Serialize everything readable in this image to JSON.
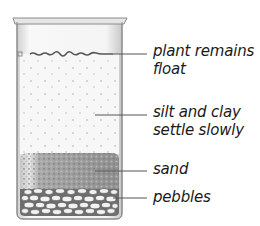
{
  "diagram": {
    "layers": [
      {
        "id": "surface",
        "label_lines": [
          "plant remains",
          "float"
        ]
      },
      {
        "id": "water",
        "label_lines": [
          "silt and clay",
          "settle slowly"
        ]
      },
      {
        "id": "sand",
        "label_lines": [
          "sand"
        ]
      },
      {
        "id": "pebbles",
        "label_lines": [
          "pebbles"
        ]
      }
    ],
    "colors": {
      "glass_outline": "#8a8a8a",
      "water": "#f6f6f6",
      "sand": "#9a9a9a",
      "pebbles": "#e8e8e8",
      "leader_line": "#555555",
      "text": "#1a1a1a"
    }
  }
}
